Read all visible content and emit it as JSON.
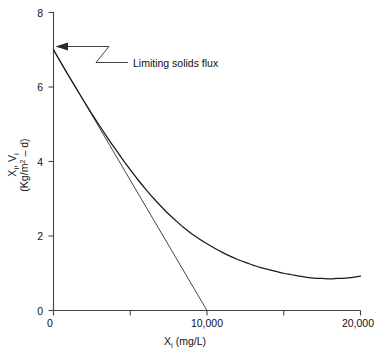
{
  "chart_data": {
    "type": "line",
    "title": "",
    "xlabel": "X_i (mg/L)",
    "xlabel_main": "X",
    "xlabel_sub": "i",
    "xlabel_units": "(mg/L)",
    "ylabel": "X_i V_i (Kg/m2 - d)",
    "ylabel_line1_main1": "X",
    "ylabel_line1_sub1": "i",
    "ylabel_line1_main2": "V",
    "ylabel_line1_sub2": "i",
    "ylabel_line2_pre": "(Kg/m",
    "ylabel_line2_sup": "2",
    "ylabel_line2_post": " – d)",
    "xlim": [
      0,
      20000
    ],
    "ylim": [
      0,
      8
    ],
    "xticks": [
      0,
      5000,
      10000,
      15000,
      20000
    ],
    "xtick_labels": [
      "0",
      "",
      "10,000",
      "",
      "20,000"
    ],
    "yticks": [
      0,
      2,
      4,
      6,
      8
    ],
    "ytick_labels": [
      "0",
      "2",
      "4",
      "6",
      "8"
    ],
    "grid": false,
    "legend": "none",
    "series": [
      {
        "name": "solids flux curve",
        "style": "curve",
        "x": [
          0,
          500,
          1000,
          1500,
          2000,
          2500,
          3000,
          3500,
          4000,
          4500,
          5000,
          5500,
          6000,
          6500,
          7000,
          7500,
          8000,
          8500,
          9000,
          9500,
          10000,
          10500,
          11000,
          11500,
          12000,
          12500,
          13000,
          13500,
          14000,
          14500,
          15000,
          15500,
          16000,
          16500,
          17000,
          17500,
          18000,
          18500,
          19000,
          19500,
          20000
        ],
        "y": [
          7.0,
          6.64,
          6.29,
          5.95,
          5.61,
          5.28,
          4.96,
          4.65,
          4.35,
          4.06,
          3.78,
          3.51,
          3.26,
          3.02,
          2.8,
          2.59,
          2.4,
          2.22,
          2.06,
          1.92,
          1.79,
          1.67,
          1.56,
          1.46,
          1.37,
          1.29,
          1.22,
          1.15,
          1.1,
          1.05,
          1.0,
          0.96,
          0.92,
          0.89,
          0.87,
          0.86,
          0.85,
          0.86,
          0.87,
          0.89,
          0.92
        ]
      },
      {
        "name": "limiting solids flux tangent",
        "style": "straight-line",
        "x": [
          0,
          10000
        ],
        "y": [
          7.0,
          0.0
        ]
      }
    ],
    "annotations": [
      {
        "name": "limiting-solids-flux",
        "text": "Limiting solids flux",
        "points_to_x": 0,
        "points_to_y": 7.0,
        "arrow": "left"
      }
    ],
    "tangent_point": {
      "x": 6700,
      "y": 2.33
    },
    "intercept_y": 7.0,
    "intercept_x": 10000,
    "curve_minimum": {
      "x": 18000,
      "y": 0.85
    },
    "colors": {
      "curve": "#1a1a1a",
      "tangent": "#3a3a3a",
      "axis": "#444444",
      "text": "#111111",
      "background": "#ffffff"
    }
  }
}
